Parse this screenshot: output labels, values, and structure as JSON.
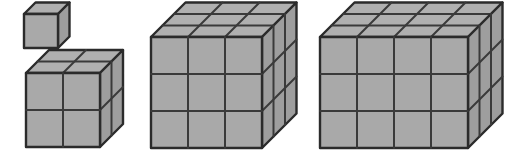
{
  "figure": {
    "background_color": "#ffffff",
    "canvas": {
      "width": 518,
      "height": 153
    }
  },
  "style": {
    "front_face_color": "#a9a9a9",
    "top_face_color": "#b0b0b0",
    "side_face_color": "#9e9e9e",
    "edge_color": "#3a3a3a",
    "outline_color": "#2b2b2b",
    "edge_width": 2,
    "outline_width": 2.4
  },
  "projection": {
    "type": "isometric-oblique",
    "depth_dx": 11.5,
    "depth_dy": -11.5
  },
  "shapes": [
    {
      "id": "shape-1",
      "name": "unit-cube",
      "label": "1 x 1 x 1",
      "cols": 1,
      "rows": 1,
      "depth": 1,
      "cube_count": 1,
      "cell": 34,
      "origin_x": 24,
      "origin_y": 48
    },
    {
      "id": "shape-2",
      "name": "two-cube",
      "label": "2 x 2 x 2",
      "cols": 2,
      "rows": 2,
      "depth": 2,
      "cube_count": 8,
      "cell": 37,
      "origin_x": 26,
      "origin_y": 147
    },
    {
      "id": "shape-3",
      "name": "three-cube",
      "label": "3 x 3 x 3",
      "cols": 3,
      "rows": 3,
      "depth": 3,
      "cube_count": 27,
      "cell": 37,
      "origin_x": 151,
      "origin_y": 148
    },
    {
      "id": "shape-4",
      "name": "four-by-three-box",
      "label": "4 x 3 x 3",
      "cols": 4,
      "rows": 3,
      "depth": 3,
      "cube_count": 36,
      "cell": 37,
      "origin_x": 320,
      "origin_y": 148
    }
  ]
}
